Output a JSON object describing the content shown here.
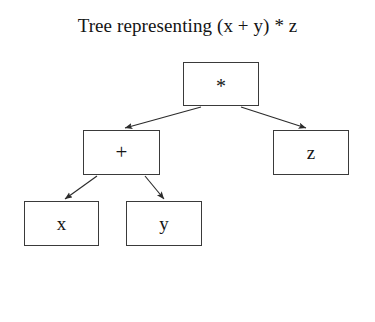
{
  "title": "Tree representing (x + y) * z",
  "colors": {
    "background": "#ffffff",
    "node_border": "#3a3a3a",
    "node_fill": "#ffffff",
    "text": "#161616",
    "edge": "#2b2b2b"
  },
  "tree": {
    "root": {
      "id": "root",
      "label": "*",
      "name": "node-multiply"
    },
    "nodes": [
      {
        "id": "root",
        "label": "*",
        "name": "node-multiply"
      },
      {
        "id": "plus",
        "label": "+",
        "name": "node-plus"
      },
      {
        "id": "z",
        "label": "z",
        "name": "node-z"
      },
      {
        "id": "x",
        "label": "x",
        "name": "node-x"
      },
      {
        "id": "y",
        "label": "y",
        "name": "node-y"
      }
    ],
    "edges": [
      {
        "from": "root",
        "to": "plus",
        "direction": "down-left"
      },
      {
        "from": "root",
        "to": "z",
        "direction": "down-right"
      },
      {
        "from": "plus",
        "to": "x",
        "direction": "down-left"
      },
      {
        "from": "plus",
        "to": "y",
        "direction": "down-right"
      }
    ]
  }
}
